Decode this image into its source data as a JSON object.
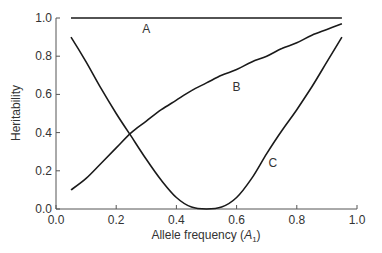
{
  "chart_data": {
    "type": "line",
    "title": "",
    "xlabel": "Allele frequency (A1)",
    "xlabel_main": "Allele frequency (",
    "xlabel_var": "A",
    "xlabel_sub": "1",
    "xlabel_close": ")",
    "ylabel": "Heritability",
    "xlim": [
      0.0,
      1.0
    ],
    "ylim": [
      0.0,
      1.0
    ],
    "xticks": [
      0.0,
      0.2,
      0.4,
      0.6,
      0.8,
      1.0
    ],
    "xtick_labels": [
      "0.0",
      "0.2",
      "0.4",
      "0.6",
      "0.8",
      "1.0"
    ],
    "yticks": [
      0.0,
      0.2,
      0.4,
      0.6,
      0.8,
      1.0
    ],
    "ytick_labels": [
      "0.0",
      "0.2",
      "0.4",
      "0.6",
      "0.8",
      "1.0"
    ],
    "grid": false,
    "legend": "none (curves labeled inline)",
    "series": [
      {
        "name": "A",
        "label_pos": [
          0.3,
          0.94
        ],
        "x": [
          0.05,
          0.95
        ],
        "y": [
          1.0,
          1.0
        ]
      },
      {
        "name": "B",
        "label_pos": [
          0.6,
          0.64
        ],
        "x": [
          0.05,
          0.1,
          0.15,
          0.2,
          0.25,
          0.3,
          0.35,
          0.4,
          0.45,
          0.5,
          0.55,
          0.6,
          0.65,
          0.7,
          0.75,
          0.8,
          0.85,
          0.9,
          0.95
        ],
        "y": [
          0.1,
          0.16,
          0.24,
          0.32,
          0.4,
          0.46,
          0.52,
          0.57,
          0.62,
          0.66,
          0.7,
          0.73,
          0.77,
          0.8,
          0.84,
          0.87,
          0.91,
          0.94,
          0.97
        ]
      },
      {
        "name": "C",
        "label_pos": [
          0.72,
          0.24
        ],
        "x": [
          0.05,
          0.1,
          0.15,
          0.2,
          0.25,
          0.3,
          0.35,
          0.4,
          0.45,
          0.5,
          0.55,
          0.6,
          0.65,
          0.7,
          0.75,
          0.8,
          0.85,
          0.9,
          0.95
        ],
        "y": [
          0.9,
          0.77,
          0.63,
          0.5,
          0.38,
          0.26,
          0.15,
          0.06,
          0.01,
          0.0,
          0.01,
          0.06,
          0.16,
          0.29,
          0.41,
          0.52,
          0.64,
          0.77,
          0.9
        ]
      }
    ]
  },
  "colors": {
    "line": "#1a1a1a",
    "axis": "#555555",
    "text": "#333333",
    "background": "#ffffff"
  }
}
